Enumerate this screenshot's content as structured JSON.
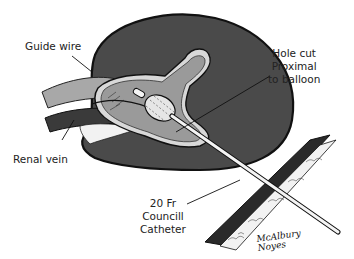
{
  "figure": {
    "labels": {
      "guide_wire": "Guide wire",
      "hole_cut": [
        "Hole cut",
        "Proximal",
        "to balloon"
      ],
      "renal_vein": "Renal vein",
      "catheter": [
        "20 Fr",
        "Councill",
        "Catheter"
      ]
    },
    "signature": [
      "McAlbury",
      "Noyes"
    ],
    "colors": {
      "kidney": "#4a4a4a",
      "outline": "#111111",
      "collecting_system": "#9a9a9a",
      "renal_pelvis_rim": "#d8d8d8",
      "vessel": "#a8a8a8",
      "vein": "#3a3a3a",
      "fat": "#f2f2f2",
      "catheter": "#f4f4f4"
    }
  }
}
